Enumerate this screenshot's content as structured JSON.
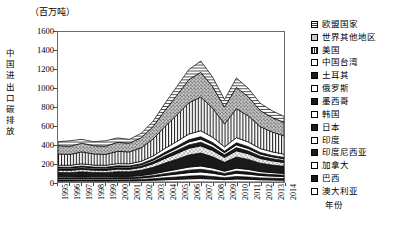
{
  "chart_data": {
    "type": "area",
    "stacked": true,
    "title": "",
    "unit_label": "（百万吨）",
    "ylabel": "中国进出口碳排放",
    "xlabel": "年份",
    "grid": false,
    "legend_position": "right",
    "ylim": [
      0,
      1600
    ],
    "ytick_values": [
      0,
      200,
      400,
      600,
      800,
      1000,
      1200,
      1400,
      1600
    ],
    "categories": [
      "1995",
      "1996",
      "1997",
      "1998",
      "1999",
      "2000",
      "2001",
      "2002",
      "2003",
      "2004",
      "2005",
      "2006",
      "2007",
      "2008",
      "2009",
      "2010",
      "2011",
      "2012",
      "2013",
      "2014"
    ],
    "totals": [
      430,
      420,
      455,
      430,
      420,
      470,
      455,
      520,
      650,
      840,
      1020,
      1200,
      1290,
      1120,
      880,
      1110,
      1000,
      840,
      760,
      700
    ],
    "series": [
      {
        "name": "澳大利亚",
        "pattern": "open",
        "values": [
          12,
          12,
          13,
          12,
          12,
          13,
          13,
          15,
          19,
          24,
          29,
          34,
          37,
          32,
          25,
          32,
          29,
          24,
          22,
          20
        ]
      },
      {
        "name": "巴西",
        "pattern": "solid-dark",
        "values": [
          10,
          10,
          11,
          10,
          10,
          11,
          11,
          13,
          16,
          21,
          25,
          29,
          31,
          27,
          21,
          27,
          24,
          20,
          18,
          17
        ]
      },
      {
        "name": "加拿大",
        "pattern": "open",
        "values": [
          13,
          13,
          14,
          13,
          13,
          14,
          14,
          16,
          20,
          26,
          31,
          37,
          40,
          35,
          27,
          34,
          31,
          26,
          23,
          21
        ]
      },
      {
        "name": "印度尼西亚",
        "pattern": "solid-dark",
        "values": [
          9,
          9,
          10,
          9,
          9,
          10,
          10,
          11,
          14,
          18,
          22,
          26,
          28,
          24,
          19,
          24,
          22,
          18,
          16,
          15
        ]
      },
      {
        "name": "印度",
        "pattern": "open",
        "values": [
          11,
          11,
          12,
          11,
          11,
          12,
          12,
          14,
          18,
          23,
          28,
          33,
          35,
          31,
          24,
          31,
          28,
          23,
          21,
          19
        ]
      },
      {
        "name": "日本",
        "pattern": "solid-dark",
        "values": [
          46,
          45,
          49,
          46,
          45,
          50,
          49,
          56,
          70,
          90,
          109,
          129,
          138,
          120,
          94,
          119,
          107,
          90,
          81,
          75
        ]
      },
      {
        "name": "韩国",
        "pattern": "dots",
        "values": [
          26,
          25,
          27,
          26,
          25,
          28,
          27,
          31,
          39,
          50,
          61,
          72,
          77,
          67,
          53,
          66,
          60,
          50,
          45,
          42
        ]
      },
      {
        "name": "墨西哥",
        "pattern": "solid-dark",
        "values": [
          13,
          13,
          14,
          13,
          13,
          14,
          14,
          16,
          20,
          26,
          31,
          36,
          39,
          34,
          27,
          34,
          30,
          25,
          23,
          21
        ]
      },
      {
        "name": "俄罗斯",
        "pattern": "open",
        "values": [
          11,
          11,
          12,
          11,
          11,
          12,
          12,
          13,
          17,
          22,
          26,
          31,
          33,
          29,
          23,
          29,
          26,
          22,
          20,
          18
        ]
      },
      {
        "name": "土耳其",
        "pattern": "solid-dark",
        "values": [
          8,
          8,
          9,
          8,
          8,
          9,
          9,
          10,
          13,
          17,
          20,
          24,
          25,
          22,
          17,
          22,
          20,
          17,
          15,
          14
        ]
      },
      {
        "name": "中国台湾",
        "pattern": "open",
        "values": [
          21,
          21,
          23,
          21,
          21,
          23,
          23,
          26,
          32,
          42,
          51,
          60,
          64,
          56,
          44,
          55,
          50,
          42,
          38,
          35
        ]
      },
      {
        "name": "美国",
        "pattern": "vlines",
        "values": [
          120,
          117,
          127,
          120,
          117,
          131,
          127,
          145,
          181,
          234,
          284,
          334,
          359,
          312,
          245,
          309,
          278,
          234,
          212,
          195
        ]
      },
      {
        "name": "世界其他地区",
        "pattern": "dots-gray",
        "values": [
          88,
          86,
          93,
          88,
          86,
          96,
          93,
          106,
          133,
          172,
          209,
          246,
          264,
          229,
          180,
          227,
          204,
          172,
          155,
          143
        ]
      },
      {
        "name": "欧盟国家",
        "pattern": "hlines",
        "values": [
          42,
          59,
          41,
          42,
          59,
          47,
          41,
          48,
          58,
          75,
          94,
          109,
          120,
          102,
          81,
          101,
          91,
          77,
          71,
          65
        ]
      }
    ]
  },
  "legend": {
    "items": [
      {
        "label": "欧盟国家"
      },
      {
        "label": "世界其他地区"
      },
      {
        "label": "美国"
      },
      {
        "label": "中国台湾"
      },
      {
        "label": "土耳其"
      },
      {
        "label": "俄罗斯"
      },
      {
        "label": "墨西哥"
      },
      {
        "label": "韩国"
      },
      {
        "label": "日本"
      },
      {
        "label": "印度"
      },
      {
        "label": "印度尼西亚"
      },
      {
        "label": "加拿大"
      },
      {
        "label": "巴西"
      },
      {
        "label": "澳大利亚"
      }
    ]
  },
  "colors": {
    "axis": "#6a6a6a",
    "text": "#000000",
    "background": "#ffffff"
  }
}
